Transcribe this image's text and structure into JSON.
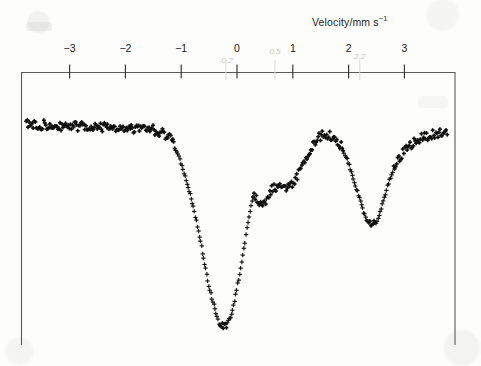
{
  "figure": {
    "caption_axis_title": "Velocity/mm s",
    "axis_title_exponent": "−1",
    "background_color": "#fdfdfc",
    "ink_color": "#101010"
  },
  "chart_data": {
    "type": "scatter",
    "title": "",
    "xlabel": "Velocity/mm s⁻¹",
    "ylabel": "",
    "xlim": [
      -3.9,
      3.9
    ],
    "ylim": [
      0.58,
      1.02
    ],
    "grid": false,
    "legend": null,
    "axis_tick_labels": [
      "−3",
      "−2",
      "−1",
      "0",
      "1",
      "2",
      "3"
    ],
    "axis_tick_values": [
      -3,
      -2,
      -1,
      0,
      1,
      2,
      3
    ],
    "axis_position": "top",
    "marker": "+",
    "series_name": "transmission",
    "annotations": [
      {
        "text": "-0.2",
        "x": -0.2,
        "kind": "ghost-artifact"
      },
      {
        "text": "0.5",
        "x": 0.68,
        "kind": "ghost-artifact"
      },
      {
        "text": "2.2",
        "x": 2.2,
        "kind": "ghost-artifact"
      }
    ],
    "features": {
      "baseline_transmission": 1.0,
      "dip_1_center": -0.21,
      "dip_1_depth": 0.395,
      "shoulder_max_center": 0.38,
      "local_dip_center": 0.8,
      "local_dip_depth": 0.125,
      "hump_max_center": 1.57,
      "dip_2_center": 2.17,
      "dip_2_depth": 0.2
    },
    "x": [
      -3.75,
      -3.68,
      -3.61,
      -3.54,
      -3.47,
      -3.4,
      -3.33,
      -3.26,
      -3.19,
      -3.12,
      -3.05,
      -2.98,
      -2.91,
      -2.84,
      -2.77,
      -2.7,
      -2.63,
      -2.56,
      -2.49,
      -2.42,
      -2.35,
      -2.28,
      -2.21,
      -2.14,
      -2.07,
      -2.0,
      -1.93,
      -1.86,
      -1.79,
      -1.72,
      -1.65,
      -1.58,
      -1.51,
      -1.44,
      -1.37,
      -1.3,
      -1.23,
      -1.16,
      -1.09,
      -1.02,
      -0.95,
      -0.88,
      -0.81,
      -0.74,
      -0.67,
      -0.6,
      -0.53,
      -0.46,
      -0.39,
      -0.32,
      -0.25,
      -0.18,
      -0.11,
      -0.04,
      0.03,
      0.1,
      0.17,
      0.24,
      0.31,
      0.38,
      0.45,
      0.52,
      0.59,
      0.66,
      0.73,
      0.8,
      0.87,
      0.94,
      1.01,
      1.08,
      1.15,
      1.22,
      1.29,
      1.36,
      1.43,
      1.5,
      1.57,
      1.64,
      1.71,
      1.78,
      1.85,
      1.92,
      1.99,
      2.06,
      2.13,
      2.2,
      2.27,
      2.34,
      2.41,
      2.48,
      2.55,
      2.62,
      2.69,
      2.76,
      2.83,
      2.9,
      2.97,
      3.04,
      3.11,
      3.18,
      3.25,
      3.32,
      3.39,
      3.46,
      3.53,
      3.6,
      3.67,
      3.74
    ],
    "y": [
      1.0,
      0.995,
      1.0,
      0.992,
      0.998,
      0.99,
      0.996,
      0.989,
      0.997,
      0.991,
      0.998,
      0.993,
      0.999,
      0.991,
      0.996,
      0.988,
      0.995,
      0.989,
      0.996,
      0.99,
      0.997,
      0.991,
      0.996,
      0.989,
      0.994,
      0.987,
      0.993,
      0.986,
      0.992,
      0.985,
      0.99,
      0.984,
      0.989,
      0.98,
      0.985,
      0.976,
      0.978,
      0.964,
      0.948,
      0.928,
      0.905,
      0.878,
      0.85,
      0.818,
      0.78,
      0.742,
      0.7,
      0.668,
      0.64,
      0.618,
      0.606,
      0.612,
      0.63,
      0.66,
      0.7,
      0.742,
      0.79,
      0.835,
      0.862,
      0.852,
      0.838,
      0.85,
      0.868,
      0.876,
      0.878,
      0.875,
      0.873,
      0.876,
      0.884,
      0.898,
      0.912,
      0.928,
      0.944,
      0.958,
      0.968,
      0.975,
      0.978,
      0.977,
      0.974,
      0.968,
      0.958,
      0.944,
      0.926,
      0.903,
      0.878,
      0.852,
      0.828,
      0.81,
      0.8,
      0.806,
      0.824,
      0.85,
      0.876,
      0.898,
      0.916,
      0.93,
      0.942,
      0.952,
      0.958,
      0.964,
      0.968,
      0.972,
      0.974,
      0.977,
      0.978,
      0.98,
      0.981,
      0.982
    ]
  }
}
